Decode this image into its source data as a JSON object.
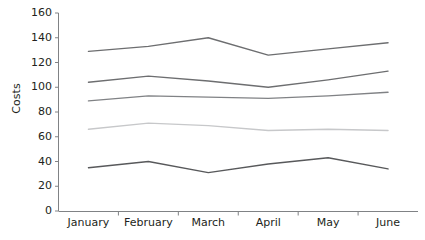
{
  "chart_data": {
    "type": "line",
    "title": "",
    "subtitle": "",
    "xlabel": "",
    "ylabel": "Costs",
    "categories": [
      "January",
      "February",
      "March",
      "April",
      "May",
      "June"
    ],
    "ylim": [
      0,
      160
    ],
    "y_ticks": [
      0,
      20,
      40,
      60,
      80,
      100,
      120,
      140,
      160
    ],
    "grid": false,
    "legend": "none",
    "markers": "none",
    "series": [
      {
        "name": "Series 1",
        "color": "#6d6e70",
        "values": [
          129,
          133,
          140,
          126,
          131,
          136
        ]
      },
      {
        "name": "Series 2",
        "color": "#6d6e70",
        "values": [
          104,
          109,
          105,
          100,
          106,
          113
        ]
      },
      {
        "name": "Series 3",
        "color": "#808285",
        "values": [
          89,
          93,
          92,
          91,
          93,
          96
        ]
      },
      {
        "name": "Series 4",
        "color": "#c7c8ca",
        "values": [
          66,
          71,
          69,
          65,
          66,
          65
        ]
      },
      {
        "name": "Series 5",
        "color": "#58595b",
        "values": [
          35,
          40,
          31,
          38,
          43,
          34
        ]
      }
    ]
  },
  "axes": {
    "y_tick_labels": [
      "160",
      "140",
      "120",
      "100",
      "80",
      "60",
      "40",
      "20",
      "0"
    ],
    "x_tick_labels": [
      "January",
      "February",
      "March",
      "April",
      "May",
      "June"
    ],
    "axis_color": "#808285",
    "text_color": "#231f20"
  }
}
